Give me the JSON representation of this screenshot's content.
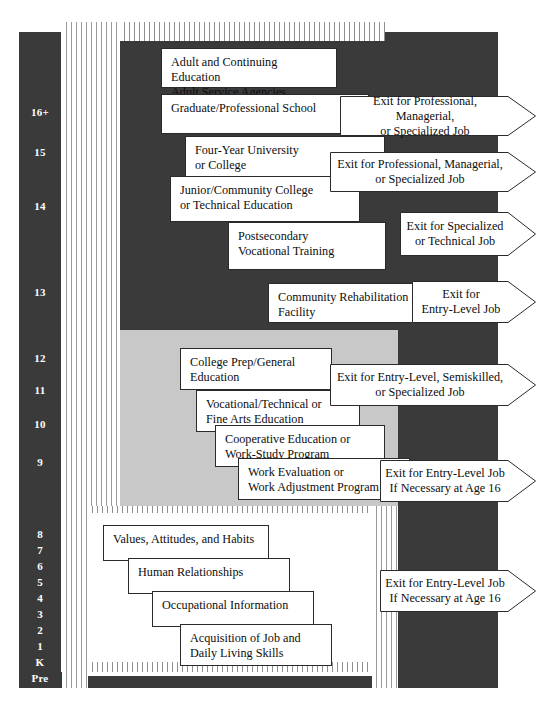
{
  "colors": {
    "dark_band": "#3a3a3a",
    "gray_band": "#c8c8c8",
    "white_band": "#ffffff",
    "box_border": "#2a2a2a",
    "grade_text": "#ffffff",
    "stripe_line": "#9a9a9a"
  },
  "grade_scale": {
    "name": "grade-level-scale",
    "labels": [
      {
        "text": "16+",
        "y": 107
      },
      {
        "text": "15",
        "y": 147
      },
      {
        "text": "14",
        "y": 201
      },
      {
        "text": "13",
        "y": 287
      },
      {
        "text": "12",
        "y": 353
      },
      {
        "text": "11",
        "y": 385
      },
      {
        "text": "10",
        "y": 419
      },
      {
        "text": "9",
        "y": 457
      },
      {
        "text": "8",
        "y": 529
      },
      {
        "text": "7",
        "y": 545
      },
      {
        "text": "6",
        "y": 561
      },
      {
        "text": "5",
        "y": 577
      },
      {
        "text": "4",
        "y": 593
      },
      {
        "text": "3",
        "y": 609
      },
      {
        "text": "2",
        "y": 625
      },
      {
        "text": "1",
        "y": 641
      },
      {
        "text": "K",
        "y": 657
      },
      {
        "text": "Pre",
        "y": 673
      }
    ]
  },
  "tiers": {
    "postsecondary": {
      "name": "postsecondary-tier",
      "band": "dark"
    },
    "secondary": {
      "name": "secondary-tier",
      "band": "gray"
    },
    "elementary": {
      "name": "elementary-tier",
      "band": "white"
    }
  },
  "boxes": [
    {
      "id": "adult-continuing-education",
      "text": "Adult and Continuing Education\nAdult Service Agencies",
      "x": 161,
      "y": 48,
      "w": 176,
      "h": 40
    },
    {
      "id": "graduate-professional-school",
      "text": "Graduate/Professional School",
      "x": 161,
      "y": 94,
      "w": 208,
      "h": 40
    },
    {
      "id": "four-year-university-or-college",
      "text": "Four-Year University\nor College",
      "x": 185,
      "y": 136,
      "w": 200,
      "h": 42
    },
    {
      "id": "junior-community-college",
      "text": "Junior/Community College\nor Technical Education",
      "x": 170,
      "y": 176,
      "w": 190,
      "h": 46
    },
    {
      "id": "postsecondary-vocational-training",
      "text": "Postsecondary\nVocational Training",
      "x": 228,
      "y": 222,
      "w": 158,
      "h": 48
    },
    {
      "id": "community-rehabilitation-facility",
      "text": "Community Rehabilitation\nFacility",
      "x": 268,
      "y": 283,
      "w": 158,
      "h": 40
    },
    {
      "id": "college-prep-general-education",
      "text": "College Prep/General\nEducation",
      "x": 180,
      "y": 348,
      "w": 152,
      "h": 42
    },
    {
      "id": "vocational-technical-fine-arts",
      "text": "Vocational/Technical or\nFine Arts Education",
      "x": 196,
      "y": 390,
      "w": 164,
      "h": 42
    },
    {
      "id": "cooperative-education-work-study",
      "text": "Cooperative Education or\nWork-Study Program",
      "x": 215,
      "y": 425,
      "w": 170,
      "h": 42
    },
    {
      "id": "work-evaluation-adjustment",
      "text": "Work Evaluation or\nWork Adjustment Program",
      "x": 238,
      "y": 458,
      "w": 172,
      "h": 42
    },
    {
      "id": "values-attitudes-habits",
      "text": "Values, Attitudes, and Habits",
      "x": 103,
      "y": 525,
      "w": 166,
      "h": 36
    },
    {
      "id": "human-relationships",
      "text": "Human Relationships",
      "x": 128,
      "y": 558,
      "w": 162,
      "h": 36
    },
    {
      "id": "occupational-information",
      "text": "Occupational Information",
      "x": 152,
      "y": 591,
      "w": 162,
      "h": 36
    },
    {
      "id": "acquisition-job-daily-living",
      "text": "Acquisition of Job and\nDaily Living Skills",
      "x": 180,
      "y": 624,
      "w": 152,
      "h": 42
    }
  ],
  "exit_arrows": [
    {
      "id": "exit-professional-managerial-1",
      "text": "Exit for Professional, Managerial,\nor Specialized Job",
      "x": 340,
      "y": 96,
      "w": 196,
      "h": 40,
      "align": "center"
    },
    {
      "id": "exit-professional-managerial-2",
      "text": "Exit for Professional, Managerial,\nor Specialized Job",
      "x": 330,
      "y": 152,
      "w": 206,
      "h": 40,
      "align": "center"
    },
    {
      "id": "exit-specialized-technical",
      "text": "Exit for Specialized\nor Technical Job",
      "x": 400,
      "y": 212,
      "w": 136,
      "h": 44,
      "align": "center"
    },
    {
      "id": "exit-entry-level-rehab",
      "text": "Exit for\nEntry-Level Job",
      "x": 412,
      "y": 281,
      "w": 124,
      "h": 42,
      "align": "center"
    },
    {
      "id": "exit-entry-level-semiskilled",
      "text": "Exit for Entry-Level, Semiskilled,\nor Specialized Job",
      "x": 330,
      "y": 364,
      "w": 206,
      "h": 42,
      "align": "center"
    },
    {
      "id": "exit-entry-level-age16-secondary",
      "text": "Exit for Entry-Level Job\nIf Necessary at Age 16",
      "x": 380,
      "y": 460,
      "w": 156,
      "h": 42,
      "align": "center"
    },
    {
      "id": "exit-entry-level-age16-elementary",
      "text": "Exit for Entry-Level Job\nIf Necessary at Age 16",
      "x": 380,
      "y": 570,
      "w": 156,
      "h": 42,
      "align": "center"
    }
  ]
}
